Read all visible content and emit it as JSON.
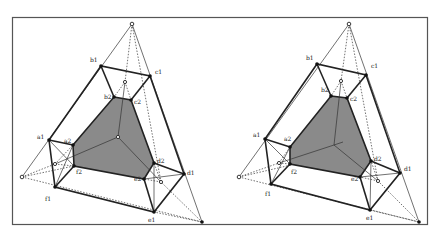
{
  "figures": [
    {
      "id": "left",
      "labels": {
        "a1": "a1",
        "a2": "a2",
        "b1": "b1",
        "b2": "b2",
        "c1": "c1",
        "c2": "c2",
        "d1": "d1",
        "d2": "d2",
        "e1": "e1",
        "e2": "e2",
        "f1": "f1",
        "f2": "f2"
      }
    },
    {
      "id": "right",
      "labels": {
        "a1": "a1",
        "a2": "a2",
        "b1": "b1",
        "b2": "b2",
        "c1": "c1",
        "c2": "c2",
        "d1": "d1",
        "d2": "d2",
        "e1": "e1",
        "e2": "e2",
        "f1": "f1",
        "f2": "f2"
      }
    }
  ],
  "colors": {
    "shaded_face": "#8a8a8a",
    "lines": "#222222",
    "frame": "#555555"
  }
}
